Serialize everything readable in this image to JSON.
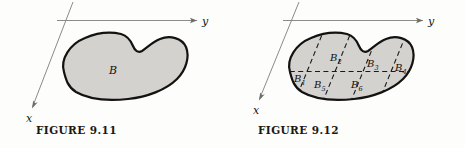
{
  "figures": [
    {
      "id": "figure-9-11",
      "caption": "FIGURE 9.11",
      "axes": {
        "x_label": "x",
        "y_label": "y"
      },
      "region_label": "B",
      "subdivided": false,
      "region_labels": []
    },
    {
      "id": "figure-9-12",
      "caption": "FIGURE 9.12",
      "axes": {
        "x_label": "x",
        "y_label": "y"
      },
      "region_label": "",
      "subdivided": true,
      "region_labels": [
        {
          "base": "B",
          "sub": "1"
        },
        {
          "base": "B",
          "sub": "2"
        },
        {
          "base": "B",
          "sub": "3"
        },
        {
          "base": "B",
          "sub": "4"
        },
        {
          "base": "B",
          "sub": "5"
        },
        {
          "base": "B",
          "sub": "6"
        }
      ]
    }
  ],
  "colors": {
    "blob_fill": "#d3d2cf",
    "blob_stroke": "#131210",
    "axis": "#8d8b86",
    "grid": "#1a1917",
    "page_background": "#fdfdfc"
  }
}
